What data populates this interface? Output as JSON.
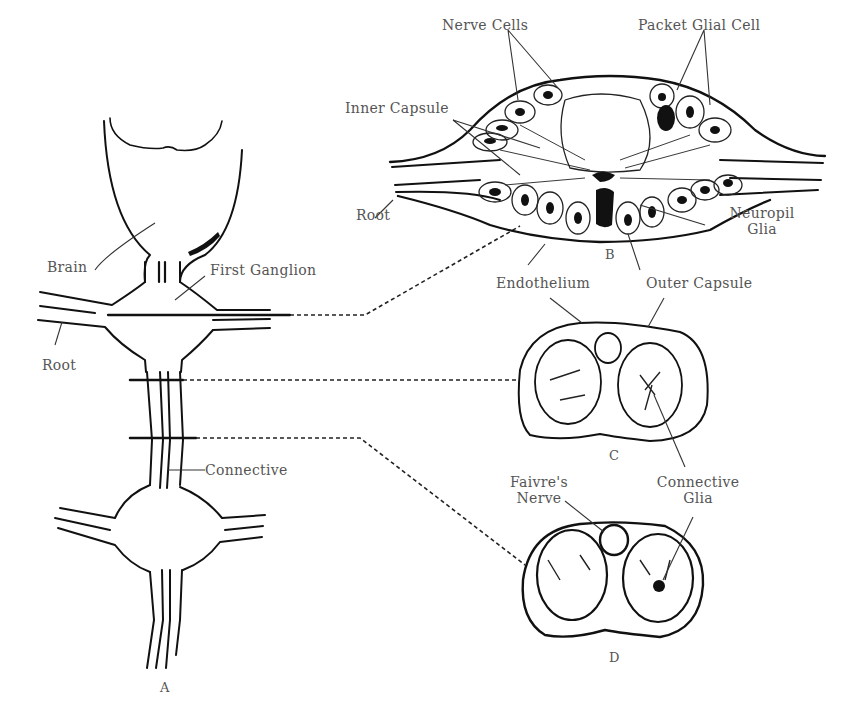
{
  "figure": {
    "panels": {
      "A": "A",
      "B": "B",
      "C": "C",
      "D": "D"
    },
    "labels": {
      "brain": "Brain",
      "first_ganglion": "First Ganglion",
      "root_a": "Root",
      "connective": "Connective",
      "nerve_cells": "Nerve Cells",
      "packet_glial_cell": "Packet Glial Cell",
      "inner_capsule": "Inner Capsule",
      "root_b": "Root",
      "neuropil_glia_line1": "Neuropil",
      "neuropil_glia_line2": "Glia",
      "endothelium": "Endothelium",
      "outer_capsule": "Outer Capsule",
      "faivres_nerve_line1": "Faivre's",
      "faivres_nerve_line2": "Nerve",
      "connective_glia_line1": "Connective",
      "connective_glia_line2": "Glia"
    }
  }
}
